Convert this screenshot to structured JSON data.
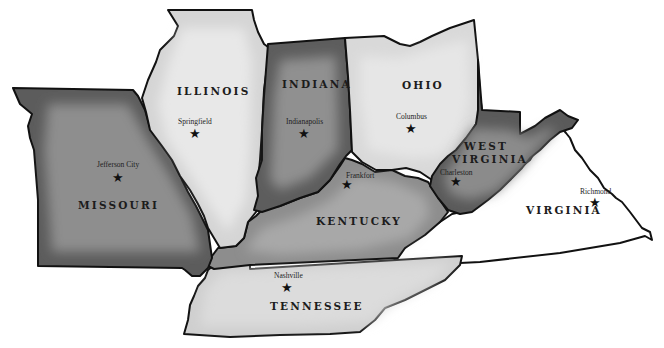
{
  "map": {
    "title": "",
    "colors": {
      "background": "#ffffff",
      "outline": "#111111",
      "light_fill": "#d9d9d9",
      "light_fill_inner": "#e6e6e6",
      "medium_fill": "#8f8f8f",
      "medium_fill_inner": "#a5a5a5",
      "dark_fill": "#5c5c5c",
      "dark_fill_inner": "#8c8c8c",
      "virginia_fill": "#ffffff"
    },
    "states": [
      {
        "name": "MISSOURI",
        "capital": "Jefferson City",
        "shade": "dark"
      },
      {
        "name": "ILLINOIS",
        "capital": "Springfield",
        "shade": "light"
      },
      {
        "name": "INDIANA",
        "capital": "Indianapolis",
        "shade": "dark"
      },
      {
        "name": "OHIO",
        "capital": "Columbus",
        "shade": "light"
      },
      {
        "name": "KENTUCKY",
        "capital": "Frankfort",
        "shade": "medium"
      },
      {
        "name": "WEST",
        "name2": "VIRGINIA",
        "capital": "Charleston",
        "shade": "dark"
      },
      {
        "name": "VIRGINIA",
        "capital": "Richmond",
        "shade": "none"
      },
      {
        "name": "TENNESSEE",
        "capital": "Nashville",
        "shade": "light"
      }
    ],
    "star_glyph": "★"
  }
}
